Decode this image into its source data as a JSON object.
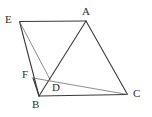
{
  "figure": {
    "width": 152,
    "height": 117,
    "background_color": "#ffffff",
    "stroke_color": "#3a3a3a",
    "light_stroke_color": "#6f6f77",
    "label_color": "#2e2e2e",
    "stroke_width": 1.1,
    "light_stroke_width": 0.8
  },
  "points": {
    "E": {
      "label": "E",
      "x": 19.5,
      "y": 21.5,
      "label_x": 5,
      "label_y": 14
    },
    "A": {
      "label": "A",
      "x": 86,
      "y": 21,
      "label_x": 82,
      "label_y": 6
    },
    "F": {
      "label": "F",
      "x": 33,
      "y": 78,
      "label_x": 22,
      "label_y": 69
    },
    "D": {
      "label": "D",
      "x": 50,
      "y": 79.5,
      "label_x": 52,
      "label_y": 82
    },
    "B": {
      "label": "B",
      "x": 39,
      "y": 96,
      "label_x": 32,
      "label_y": 99
    },
    "C": {
      "label": "C",
      "x": 127.5,
      "y": 94.5,
      "label_x": 133,
      "label_y": 88
    }
  },
  "segments": [
    {
      "name": "segment-EA",
      "from": "E",
      "to": "A",
      "style": "dark"
    },
    {
      "name": "segment-EB",
      "from": "E",
      "to": "B",
      "style": "dark"
    },
    {
      "name": "segment-ED",
      "from": "E",
      "to": "D",
      "style": "light"
    },
    {
      "name": "segment-AB",
      "from": "A",
      "to": "B",
      "style": "dark"
    },
    {
      "name": "segment-AC",
      "from": "A",
      "to": "C",
      "style": "dark"
    },
    {
      "name": "segment-BC",
      "from": "B",
      "to": "C",
      "style": "dark"
    },
    {
      "name": "segment-FB",
      "from": "F",
      "to": "B",
      "style": "dark"
    },
    {
      "name": "segment-FC",
      "from": "F",
      "to": "C",
      "style": "light"
    }
  ],
  "vertex_order": [
    "E",
    "A",
    "F",
    "D",
    "B",
    "C"
  ]
}
